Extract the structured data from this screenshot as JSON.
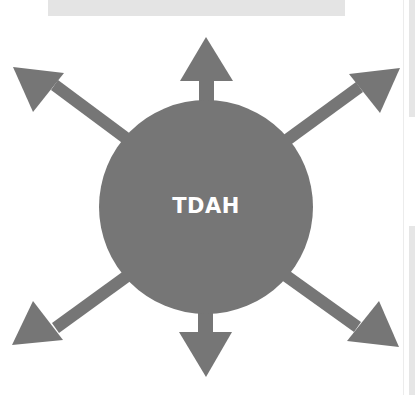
{
  "diagram": {
    "type": "radial",
    "center": {
      "label": "TDAH",
      "shape": "circle"
    },
    "arrows": [
      {
        "direction": "up",
        "label": ""
      },
      {
        "direction": "up-right",
        "label": ""
      },
      {
        "direction": "down-right",
        "label": ""
      },
      {
        "direction": "down",
        "label": ""
      },
      {
        "direction": "down-left",
        "label": ""
      },
      {
        "direction": "up-left",
        "label": ""
      }
    ]
  },
  "colors": {
    "shape_fill": "#767676",
    "text": "#ffffff",
    "background": "#ffffff",
    "top_bar": "#e4e4e4"
  }
}
